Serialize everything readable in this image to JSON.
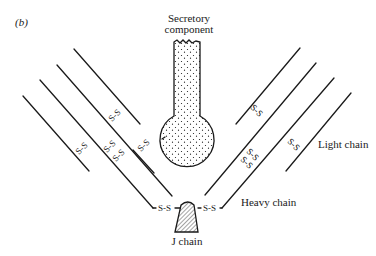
{
  "figure": {
    "panel_label": "(b)",
    "labels": {
      "secretory_component_line1": "Secretory",
      "secretory_component_line2": "component",
      "light_chain": "Light chain",
      "heavy_chain": "Heavy chain",
      "j_chain": "J chain"
    },
    "disulfide_bond_text": "S-S",
    "colors": {
      "ink": "#1a1a1a",
      "background": "#ffffff"
    }
  }
}
